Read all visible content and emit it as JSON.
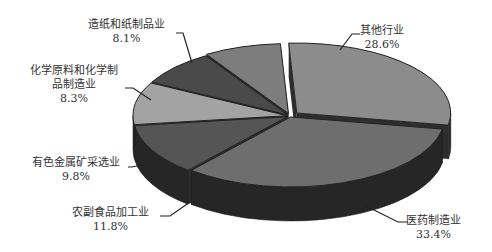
{
  "chart_data": {
    "type": "pie",
    "style": "3d-exploded",
    "title": "",
    "categories": [
      "其他行业",
      "医药制造业",
      "农副食品加工业",
      "有色金属矿采选业",
      "化学原料和化学制品制造业",
      "造纸和纸制品业"
    ],
    "values": [
      28.6,
      33.4,
      11.8,
      9.8,
      8.3,
      8.1
    ],
    "unit": "%",
    "legend": "none (callout labels)",
    "colors": [
      "#8c8c8c",
      "#6e6e6e",
      "#555555",
      "#a3a3a3",
      "#4a4a4a",
      "#7d7d7d"
    ]
  },
  "labels": [
    {
      "name": "其他行业",
      "line1": "其他行业",
      "value": "28.6%"
    },
    {
      "name": "医药制造业",
      "line1": "医药制造业",
      "value": "33.4%"
    },
    {
      "name": "农副食品加工业",
      "line1": "农副食品加工业",
      "value": "11.8%"
    },
    {
      "name": "有色金属矿采选业",
      "line1": "有色金属矿采选业",
      "value": "9.8%"
    },
    {
      "name": "化学原料和化学制品制造业",
      "line1": "化学原料和化学制",
      "line2": "品制造业",
      "value": "8.3%"
    },
    {
      "name": "造纸和纸制品业",
      "line1": "造纸和纸制品业",
      "value": "8.1%"
    }
  ]
}
